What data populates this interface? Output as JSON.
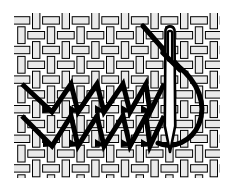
{
  "figure": {
    "title": "Herringbone stitch worked on woven fabric with threaded needle",
    "caption": "",
    "width": 233,
    "height": 191,
    "background_color": "#ffffff"
  },
  "fabric": {
    "name": "plain-weave-fabric",
    "description": "Basket / plain weave grid of interlacing warp and weft threads",
    "thread_fill_color": "#eaeaea",
    "thread_outline_color": "#000000",
    "outline_width": 1,
    "bounds": {
      "x": 14,
      "y": 13,
      "width": 206,
      "height": 165
    },
    "cell_size": 14.8,
    "columns": 14,
    "rows": 11,
    "thread_thickness": 7.4
  },
  "stitching": {
    "name": "herringbone-stitch-rows",
    "stitch_color": "#000000",
    "stitch_width": 5,
    "row_count": 2,
    "arrow_count_per_row": 5,
    "rows": [
      {
        "label": "upper-stitch-row",
        "start_x": 22,
        "top_y": 84,
        "bottom_y": 112,
        "arrow_x_positions": [
          52,
          78,
          104,
          130,
          150
        ]
      },
      {
        "label": "lower-stitch-row",
        "start_x": 22,
        "top_y": 116,
        "bottom_y": 146,
        "arrow_x_positions": [
          52,
          78,
          104,
          130,
          150
        ]
      }
    ]
  },
  "needle": {
    "name": "sewing-needle",
    "body_color": "#ffffff",
    "outline_color": "#000000",
    "orientation": "vertical",
    "top_y": 24,
    "tip_y": 152,
    "center_x": 170,
    "shaft_width": 9,
    "eye": {
      "name": "needle-eye",
      "shape": "elongated-slot",
      "top_y": 29,
      "bottom_y": 62,
      "width": 4
    }
  },
  "thread": {
    "name": "working-thread",
    "color": "#000000",
    "width": 5,
    "entry_point": {
      "x": 143,
      "y": 26
    },
    "loop_rightmost_x": 207,
    "loop_bottom_y": 147,
    "description": "Thread passes through the needle eye, sweeps right in a long loop and returns under the needle tip"
  },
  "palette": {
    "ink": "#000000",
    "fabric_thread": "#eaeaea",
    "paper": "#ffffff"
  }
}
